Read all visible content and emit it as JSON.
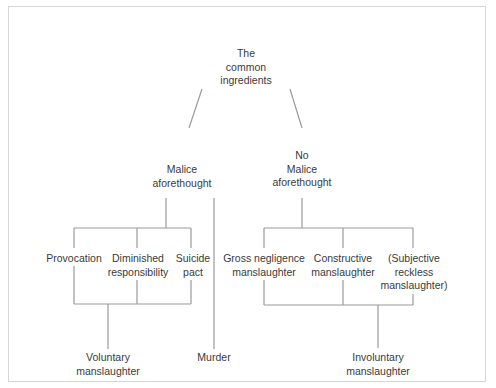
{
  "diagram": {
    "root": {
      "lines": [
        "The",
        "common",
        "ingredients"
      ]
    },
    "branches": {
      "malice": {
        "lines": [
          "Malice",
          "aforethought"
        ]
      },
      "no_malice": {
        "lines": [
          "No",
          "Malice",
          "aforethought"
        ]
      }
    },
    "malice_children": [
      {
        "lines": [
          "Provocation"
        ]
      },
      {
        "lines": [
          "Diminished",
          "responsibility"
        ]
      },
      {
        "lines": [
          "Suicide",
          "pact"
        ]
      }
    ],
    "no_malice_children": [
      {
        "lines": [
          "Gross negligence",
          "manslaughter"
        ]
      },
      {
        "lines": [
          "Constructive",
          "manslaughter"
        ]
      },
      {
        "lines": [
          "(Subjective",
          "reckless",
          "manslaughter)"
        ]
      }
    ],
    "outcomes": {
      "voluntary": {
        "lines": [
          "Voluntary",
          "manslaughter"
        ]
      },
      "murder": {
        "lines": [
          "Murder"
        ]
      },
      "involuntary": {
        "lines": [
          "Involuntary",
          "manslaughter"
        ]
      }
    },
    "colors": {
      "line": "#9a9a9a",
      "text": "#3a3a3a",
      "frame": "#d6d6d6",
      "background": "#ffffff"
    }
  }
}
